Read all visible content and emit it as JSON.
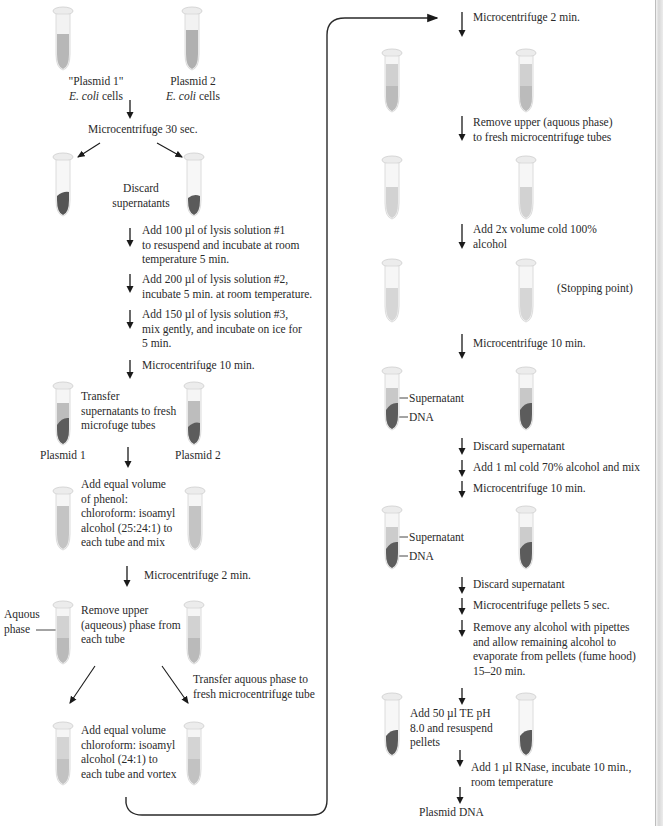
{
  "diagram": {
    "colors": {
      "text": "#2a2a2a",
      "arrow": "#1a1a1a",
      "liquid": "#b9b9b9",
      "liquid_light": "#d0d0d0",
      "pellet": "#5a5a5a",
      "tube_cap": "#e8e8e8"
    },
    "left_column": {
      "start_labels": {
        "tube1": "\"Plasmid 1\"",
        "tube1_sub_italic": "E. coli",
        "tube1_sub": " cells",
        "tube2": "Plasmid 2",
        "tube2_sub_italic": "E. coli",
        "tube2_sub": " cells"
      },
      "steps": [
        {
          "id": "s1",
          "text": "Microcentrifuge 30 sec."
        },
        {
          "id": "s2",
          "lines": [
            "Discard",
            "supernatants"
          ]
        },
        {
          "id": "s3",
          "lines": [
            "Add 100 µl of lysis solution #1",
            "to resuspend and incubate at room",
            "temperature 5 min."
          ]
        },
        {
          "id": "s4",
          "lines": [
            "Add 200 µl of lysis solution #2,",
            "incubate 5 min. at room temperature."
          ]
        },
        {
          "id": "s5",
          "lines": [
            "Add 150 µl of lysis solution #3,",
            "mix gently, and incubate on ice for",
            "5 min."
          ]
        },
        {
          "id": "s6",
          "text": "Microcentrifuge 10 min."
        },
        {
          "id": "s7",
          "lines": [
            "Transfer",
            "supernatants to fresh",
            "microfuge tubes"
          ]
        },
        {
          "id": "s8",
          "lines": [
            "Add equal volume",
            "of phenol:",
            "chloroform: isoamyl",
            "alcohol (25:24:1) to",
            "each tube and mix"
          ]
        },
        {
          "id": "s9",
          "text": "Microcentrifuge 2 min."
        },
        {
          "id": "s10",
          "lines": [
            "Remove upper",
            "(aqueous) phase from",
            "each tube"
          ]
        },
        {
          "id": "s11",
          "lines": [
            "Transfer aquous phase to",
            "fresh microcentrifuge tube"
          ]
        },
        {
          "id": "s12",
          "lines": [
            "Add equal volume",
            "chloroform: isoamyl",
            "alcohol (24:1) to",
            "each tube and vortex"
          ]
        }
      ],
      "tube_labels": {
        "plasmid1": "Plasmid 1",
        "plasmid2": "Plasmid 2",
        "aqueous_phase": [
          "Aquous",
          "phase"
        ]
      }
    },
    "right_column": {
      "steps": [
        {
          "id": "r1",
          "text": "Microcentrifuge 2 min."
        },
        {
          "id": "r2",
          "lines": [
            "Remove upper (aquous phase)",
            "to fresh microcentrifuge tubes"
          ]
        },
        {
          "id": "r3",
          "lines": [
            "Add 2x volume cold 100%",
            "alcohol"
          ]
        },
        {
          "id": "r4",
          "text": "(Stopping point)"
        },
        {
          "id": "r5",
          "text": "Microcentrifuge 10 min."
        },
        {
          "id": "r6",
          "text": "Discard supernatant"
        },
        {
          "id": "r7",
          "text": "Add 1 ml cold 70% alcohol and mix"
        },
        {
          "id": "r8",
          "text": "Microcentrifuge 10 min."
        },
        {
          "id": "r9",
          "text": "Discard supernatant"
        },
        {
          "id": "r10",
          "text": "Microcentrifuge pellets 5 sec."
        },
        {
          "id": "r11",
          "lines": [
            "Remove any alcohol with pipettes",
            "and allow remaining alcohol to",
            "evaporate from pellets (fume hood)",
            "15–20 min."
          ]
        },
        {
          "id": "r12",
          "lines": [
            "Add 50 µl TE pH",
            "8.0 and resuspend",
            "pellets"
          ]
        },
        {
          "id": "r13",
          "lines": [
            "Add 1 µl RNase, incubate 10 min.,",
            "room temperature"
          ]
        },
        {
          "id": "r14",
          "text": "Plasmid DNA"
        }
      ],
      "tube_labels": {
        "supernatant": "Supernatant",
        "dna": "DNA"
      }
    }
  }
}
